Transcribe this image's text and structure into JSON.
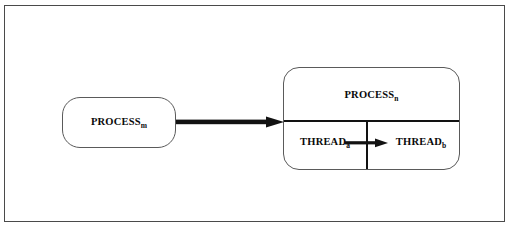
{
  "figure": {
    "background_color": "#ffffff",
    "frame_color": "#4a4a4a",
    "line_color": "#121212",
    "box_border_color": "#5a5a5a"
  },
  "nodes": {
    "process_m": {
      "label": "PROCESS",
      "subscript": "m"
    },
    "process_n": {
      "label": "PROCESS",
      "subscript": "n"
    },
    "thread_a": {
      "label": "THREAD",
      "subscript": "a"
    },
    "thread_b": {
      "label": "THREAD",
      "subscript": "b"
    }
  },
  "edges": {
    "ipc_arrow": {
      "from": "process_m",
      "to": "process_n",
      "style": "thick-solid-arrow"
    },
    "thread_arrow": {
      "from": "thread_a",
      "to": "thread_b",
      "style": "solid-arrow"
    }
  }
}
